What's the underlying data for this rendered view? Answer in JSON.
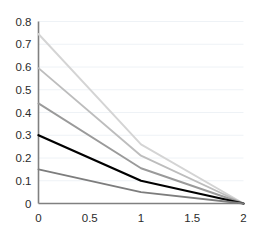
{
  "chart_data": {
    "type": "line",
    "title": "",
    "xlabel": "",
    "ylabel": "",
    "xlim": [
      0,
      2
    ],
    "ylim": [
      0,
      0.8
    ],
    "grid": true,
    "grid_axis": "y",
    "legend": "none",
    "x": [
      0,
      1,
      2
    ],
    "series": [
      {
        "name": "series-1",
        "values": [
          0.745,
          0.26,
          0.0
        ],
        "color": "#d4d4d4"
      },
      {
        "name": "series-2",
        "values": [
          0.595,
          0.21,
          0.0
        ],
        "color": "#bdbdbd"
      },
      {
        "name": "series-3",
        "values": [
          0.44,
          0.155,
          0.0
        ],
        "color": "#9a9a9a"
      },
      {
        "name": "series-4",
        "values": [
          0.3,
          0.1,
          0.0
        ],
        "color": "#000000"
      },
      {
        "name": "series-5",
        "values": [
          0.15,
          0.05,
          0.0
        ],
        "color": "#7d7d7d"
      }
    ],
    "xticks": [
      0,
      0.5,
      1,
      1.5,
      2
    ],
    "xtick_labels": [
      "0",
      "0.5",
      "1",
      "1.5",
      "2"
    ],
    "yticks": [
      0,
      0.1,
      0.2,
      0.3,
      0.4,
      0.5,
      0.6,
      0.7,
      0.8
    ],
    "ytick_labels": [
      "0",
      "0.1",
      "0.2",
      "0.3",
      "0.4",
      "0.5",
      "0.6",
      "0.7",
      "0.8"
    ],
    "colors": {
      "axis": "#808080",
      "grid": "#eef2f6",
      "tick_label": "#2b2b2b",
      "background": "#ffffff"
    }
  }
}
